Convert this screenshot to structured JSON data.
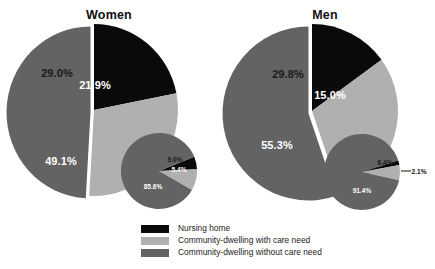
{
  "chart_data": {
    "type": "pie",
    "title": "",
    "legend_position": "bottom-center",
    "legend": [
      {
        "label": "Nursing home",
        "color": "#0a0a0a"
      },
      {
        "label": "Community-dwelling with care need",
        "color": "#b0b0b0"
      },
      {
        "label": "Community-dwelling without care need",
        "color": "#636363"
      }
    ],
    "panels": [
      {
        "name": "women",
        "title": "Women",
        "main_pie": {
          "categories": [
            "Nursing home",
            "Community-dwelling with care need",
            "Community-dwelling without care need"
          ],
          "values": [
            21.9,
            29.0,
            49.1
          ],
          "labels": [
            "21.9%",
            "29.0%",
            "49.1%"
          ],
          "colors": [
            "#0a0a0a",
            "#b0b0b0",
            "#636363"
          ]
        },
        "inset_pie": {
          "categories": [
            "Nursing home",
            "Community-dwelling with care need",
            "Community-dwelling without care need"
          ],
          "values": [
            5.4,
            9.0,
            85.6
          ],
          "labels": [
            "5.4%",
            "9.0%",
            "85.6%"
          ],
          "colors": [
            "#0a0a0a",
            "#b0b0b0",
            "#636363"
          ]
        }
      },
      {
        "name": "men",
        "title": "Men",
        "main_pie": {
          "categories": [
            "Nursing home",
            "Community-dwelling with care need",
            "Community-dwelling without care need"
          ],
          "values": [
            15.0,
            29.8,
            55.3
          ],
          "labels": [
            "15.0%",
            "29.8%",
            "55.3%"
          ],
          "colors": [
            "#0a0a0a",
            "#b0b0b0",
            "#636363"
          ]
        },
        "inset_pie": {
          "categories": [
            "Nursing home",
            "Community-dwelling with care need",
            "Community-dwelling without care need"
          ],
          "values": [
            2.1,
            6.4,
            91.4
          ],
          "labels": [
            "2.1%",
            "6.4%",
            "91.4%"
          ],
          "colors": [
            "#0a0a0a",
            "#b0b0b0",
            "#636363"
          ]
        }
      }
    ],
    "colors": {
      "nursing_home": "#0a0a0a",
      "with_care_need": "#b0b0b0",
      "without_care_need": "#636363",
      "background": "#ffffff"
    }
  }
}
